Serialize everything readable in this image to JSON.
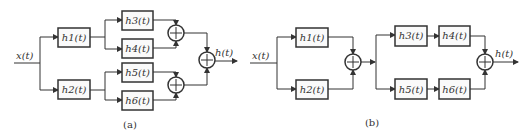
{
  "diagram_a": {
    "caption": "(a)",
    "input": "x(t)",
    "output": "h(t)",
    "blocks": {
      "h1": "h1(t)",
      "h2": "h2(t)",
      "h3": "h3(t)",
      "h4": "h4(t)",
      "h5": "h5(t)",
      "h6": "h6(t)"
    }
  },
  "diagram_b": {
    "caption": "(b)",
    "input": "x(t)",
    "output": "h(t)",
    "blocks": {
      "h1": "h1(t)",
      "h2": "h2(t)",
      "h3": "h3(t)",
      "h4": "h4(t)",
      "h5": "h5(t)",
      "h6": "h6(t)"
    }
  },
  "colors": {
    "stroke": "#333333",
    "background": "#ffffff"
  }
}
